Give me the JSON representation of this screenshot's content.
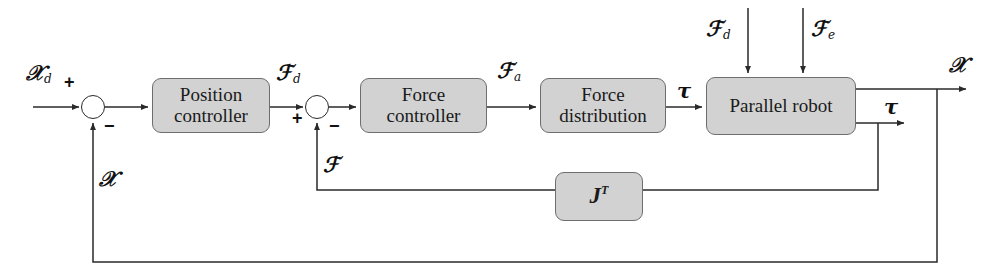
{
  "diagram": {
    "type": "control-block-diagram",
    "canvas": {
      "width": 1003,
      "height": 277
    },
    "colors": {
      "block_fill": "#d2d2d2",
      "block_stroke": "#6e6e6e",
      "wire": "#2a2a2a",
      "background": "#ffffff",
      "text": "#111111"
    }
  },
  "blocks": [
    {
      "id": "position-controller",
      "line1": "Position",
      "line2": "controller",
      "x": 152,
      "y": 78,
      "w": 118,
      "h": 55
    },
    {
      "id": "force-controller",
      "line1": "Force",
      "line2": "controller",
      "x": 360,
      "y": 78,
      "w": 127,
      "h": 55
    },
    {
      "id": "force-distribution",
      "line1": "Force",
      "line2": "distribution",
      "x": 540,
      "y": 78,
      "w": 126,
      "h": 55
    },
    {
      "id": "parallel-robot",
      "line1": "Parallel robot",
      "line2": "",
      "x": 706,
      "y": 77,
      "w": 150,
      "h": 58
    },
    {
      "id": "jacobian-transpose",
      "base": "J",
      "exponent": "T",
      "x": 555,
      "y": 172,
      "w": 88,
      "h": 49
    }
  ],
  "summing_junctions": [
    {
      "id": "position-error-sum",
      "cx": 93,
      "cy": 107,
      "r": 12,
      "signs": [
        {
          "label": "+",
          "x": 64,
          "y": 80
        },
        {
          "label": "−",
          "x": 104,
          "y": 122
        }
      ]
    },
    {
      "id": "force-error-sum",
      "cx": 317,
      "cy": 107,
      "r": 12,
      "signs": [
        {
          "label": "+",
          "x": 294,
          "y": 112
        },
        {
          "label": "−",
          "x": 329,
          "y": 122
        }
      ]
    }
  ],
  "signal_labels": [
    {
      "id": "desired-pose-input",
      "symbol": "𝒳",
      "sub": "d",
      "x": 28,
      "y": 66
    },
    {
      "id": "desired-wrench",
      "symbol": "ℱ",
      "sub": "d",
      "x": 276,
      "y": 66
    },
    {
      "id": "actuation-wrench",
      "symbol": "ℱ",
      "sub": "a",
      "x": 497,
      "y": 64
    },
    {
      "id": "joint-torque-mid",
      "symbol": "τ",
      "sub": "",
      "x": 677,
      "y": 84
    },
    {
      "id": "disturbance-wrench",
      "symbol": "ℱ",
      "sub": "d",
      "x": 708,
      "y": 22
    },
    {
      "id": "environment-wrench",
      "symbol": "ℱ",
      "sub": "e",
      "x": 812,
      "y": 22
    },
    {
      "id": "pose-output",
      "symbol": "𝒳",
      "sub": "",
      "x": 950,
      "y": 58
    },
    {
      "id": "torque-output",
      "symbol": "τ",
      "sub": "",
      "x": 886,
      "y": 100
    },
    {
      "id": "measured-wrench-feedback",
      "symbol": "ℱ",
      "sub": "",
      "x": 324,
      "y": 158
    },
    {
      "id": "pose-feedback",
      "symbol": "𝒳",
      "sub": "",
      "x": 100,
      "y": 172
    }
  ]
}
